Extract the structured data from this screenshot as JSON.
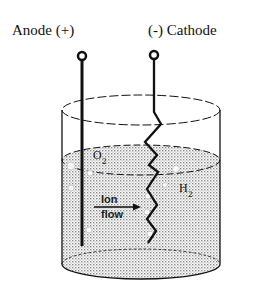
{
  "diagram": {
    "type": "electrolysis-cell",
    "labels": {
      "anode": "Anode (+)",
      "cathode": "(-) Cathode",
      "oxygen": "O",
      "oxygen_sub": "2",
      "hydrogen": "H",
      "hydrogen_sub": "2",
      "ion_line1": "Ion",
      "ion_line2": "flow"
    },
    "colors": {
      "stroke": "#111111",
      "liquid_dot": "#8a8a8a",
      "background": "#ffffff"
    }
  }
}
